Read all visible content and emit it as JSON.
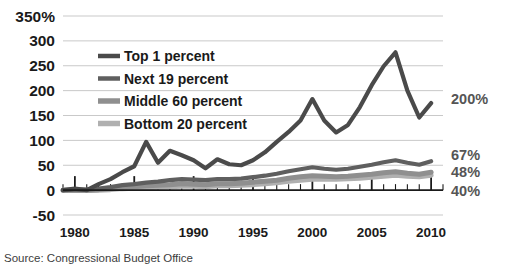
{
  "source_note": "Source: Congressional Budget Office",
  "axis": {
    "y_ticks": [
      "350%",
      "300",
      "250",
      "200",
      "150",
      "100",
      "50",
      "0",
      "-50"
    ],
    "x_ticks": [
      "1980",
      "1985",
      "1990",
      "1995",
      "2000",
      "2005",
      "2010"
    ]
  },
  "legend": {
    "items": [
      {
        "label": "Top 1 percent",
        "color": "#4a4a4a"
      },
      {
        "label": "Next 19 percent",
        "color": "#5f5f5f"
      },
      {
        "label": "Middle 60 percent",
        "color": "#8f8f8f"
      },
      {
        "label": "Bottom 20 percent",
        "color": "#b0b0b0"
      }
    ]
  },
  "end_labels": [
    {
      "text": "200%",
      "series": "Top 1 percent"
    },
    {
      "text": "67%",
      "series": "Next 19 percent"
    },
    {
      "text": "48%",
      "series": "Middle 60 percent"
    },
    {
      "text": "40%",
      "series": "Bottom 20 percent"
    }
  ],
  "chart_data": {
    "type": "line",
    "title": "",
    "subtitle": "",
    "xlabel": "",
    "ylabel": "",
    "xlim": [
      1979,
      2011
    ],
    "ylim": [
      -50,
      350
    ],
    "ytick_values": [
      350,
      300,
      250,
      200,
      150,
      100,
      50,
      0,
      -50
    ],
    "xtick_values": [
      1980,
      1985,
      1990,
      1995,
      2000,
      2005,
      2010
    ],
    "xtick_labeled_every": 5,
    "grid": "horizontal",
    "legend_position": "upper-left-inside",
    "x": [
      1979,
      1980,
      1981,
      1982,
      1983,
      1984,
      1985,
      1986,
      1987,
      1988,
      1989,
      1990,
      1991,
      1992,
      1993,
      1994,
      1995,
      1996,
      1997,
      1998,
      1999,
      2000,
      2001,
      2002,
      2003,
      2004,
      2005,
      2006,
      2007,
      2008,
      2009,
      2010
    ],
    "series": [
      {
        "name": "Top 1 percent",
        "color": "#4a4a4a",
        "end_label": "200%",
        "values": [
          0,
          3,
          0,
          12,
          22,
          36,
          48,
          97,
          55,
          79,
          70,
          60,
          44,
          62,
          52,
          50,
          60,
          76,
          97,
          117,
          140,
          183,
          140,
          116,
          131,
          167,
          211,
          249,
          277,
          200,
          146,
          175
        ]
      },
      {
        "name": "Next 19 percent",
        "color": "#5f5f5f",
        "end_label": "67%",
        "values": [
          0,
          1,
          1,
          3,
          6,
          10,
          12,
          15,
          17,
          20,
          22,
          21,
          20,
          22,
          22,
          23,
          26,
          29,
          33,
          38,
          42,
          46,
          43,
          41,
          43,
          47,
          51,
          56,
          60,
          55,
          51,
          58
        ]
      },
      {
        "name": "Middle 60 percent",
        "color": "#8f8f8f",
        "end_label": "48%",
        "values": [
          0,
          0,
          0,
          1,
          3,
          6,
          7,
          9,
          10,
          11,
          13,
          12,
          11,
          13,
          13,
          14,
          16,
          18,
          20,
          24,
          27,
          29,
          28,
          27,
          28,
          30,
          32,
          35,
          37,
          34,
          32,
          36
        ]
      },
      {
        "name": "Bottom 20 percent",
        "color": "#b0b0b0",
        "end_label": "40%",
        "values": [
          0,
          -1,
          -1,
          0,
          1,
          3,
          4,
          5,
          6,
          7,
          8,
          8,
          7,
          9,
          9,
          10,
          11,
          13,
          15,
          18,
          20,
          22,
          22,
          22,
          23,
          24,
          26,
          28,
          30,
          28,
          27,
          30
        ]
      }
    ]
  }
}
